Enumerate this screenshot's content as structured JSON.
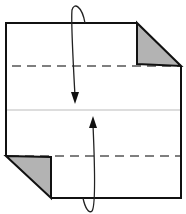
{
  "diagram": {
    "type": "origami-fold-diagram",
    "colors": {
      "outline": "#111111",
      "flap_fill": "#b3b3b3",
      "dashed_line": "#555555",
      "center_line": "#bbbbbb",
      "arrow": "#222222"
    },
    "elements": [
      {
        "name": "paper-outline",
        "kind": "polygon"
      },
      {
        "name": "top-right-flap",
        "kind": "shaded-triangle"
      },
      {
        "name": "bottom-left-flap",
        "kind": "shaded-triangle"
      },
      {
        "name": "top-valley-fold-line",
        "kind": "dashed-line"
      },
      {
        "name": "bottom-valley-fold-line",
        "kind": "dashed-line"
      },
      {
        "name": "center-crease-line",
        "kind": "thin-line"
      },
      {
        "name": "fold-down-arrow",
        "kind": "arrow"
      },
      {
        "name": "fold-up-arrow",
        "kind": "arrow"
      }
    ]
  }
}
